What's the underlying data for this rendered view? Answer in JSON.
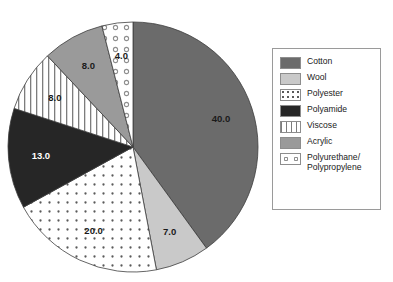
{
  "chart_data": {
    "type": "pie",
    "title": "",
    "xlabel": "",
    "ylabel": "",
    "legend_position": "right",
    "grid": false,
    "total": 100,
    "start_angle_deg": 0,
    "direction": "clockwise",
    "categories": [
      "Cotton",
      "Wool",
      "Polyester",
      "Polyamide",
      "Viscose",
      "Acrylic",
      "Polyurethane/\nPolypropylene"
    ],
    "values": [
      40.0,
      7.0,
      20.0,
      13.0,
      8.0,
      8.0,
      4.0
    ],
    "data_labels": [
      "40.0",
      "7.0",
      "20.0",
      "13.0",
      "8.0",
      "8.0",
      "4.0"
    ],
    "slices": [
      {
        "label": "Cotton",
        "value": 40.0,
        "data_label": "40.0",
        "fill": "#6b6b6b",
        "pattern": "solid",
        "label_color": "dark"
      },
      {
        "label": "Wool",
        "value": 7.0,
        "data_label": "7.0",
        "fill": "#c9c9c9",
        "pattern": "solid",
        "label_color": "dark"
      },
      {
        "label": "Polyester",
        "value": 20.0,
        "data_label": "20.0",
        "fill": "#ffffff",
        "pattern": "dots-dense",
        "label_color": "dark"
      },
      {
        "label": "Polyamide",
        "value": 13.0,
        "data_label": "13.0",
        "fill": "#262626",
        "pattern": "solid",
        "label_color": "light"
      },
      {
        "label": "Viscose",
        "value": 8.0,
        "data_label": "8.0",
        "fill": "#ffffff",
        "pattern": "vertical-stripes",
        "label_color": "dark"
      },
      {
        "label": "Acrylic",
        "value": 8.0,
        "data_label": "8.0",
        "fill": "#9a9a9a",
        "pattern": "solid",
        "label_color": "dark"
      },
      {
        "label": "Polyurethane/\nPolypropylene",
        "value": 4.0,
        "data_label": "4.0",
        "fill": "#ffffff",
        "pattern": "circles-sparse",
        "label_color": "dark"
      }
    ]
  },
  "legend": {
    "items": [
      {
        "label": "Cotton",
        "swatch": "#6b6b6b",
        "pattern": "solid"
      },
      {
        "label": "Wool",
        "swatch": "#c9c9c9",
        "pattern": "solid"
      },
      {
        "label": "Polyester",
        "swatch": "#ffffff",
        "pattern": "dots-dense"
      },
      {
        "label": "Polyamide",
        "swatch": "#262626",
        "pattern": "solid"
      },
      {
        "label": "Viscose",
        "swatch": "#ffffff",
        "pattern": "vertical-stripes"
      },
      {
        "label": "Acrylic",
        "swatch": "#9a9a9a",
        "pattern": "solid"
      },
      {
        "label": "Polyurethane/\nPolypropylene",
        "swatch": "#ffffff",
        "pattern": "circles-sparse"
      }
    ]
  },
  "geometry": {
    "center_x": 133,
    "center_y": 147,
    "radius": 125,
    "label_radius_ratio": 0.74
  }
}
